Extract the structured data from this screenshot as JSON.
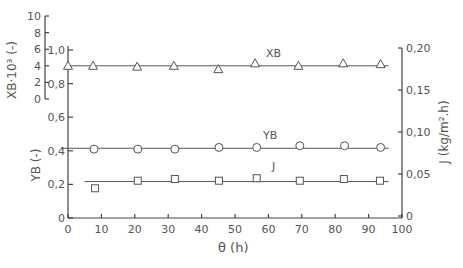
{
  "chart_data": {
    "type": "line",
    "title": "",
    "xlabel": "θ (h)",
    "xlim": [
      0,
      100
    ],
    "x_ticks": [
      0,
      10,
      20,
      30,
      40,
      50,
      60,
      70,
      80,
      90,
      100
    ],
    "axes": {
      "left_outer": {
        "label": "XB·10³ (-)",
        "lim": [
          0,
          10
        ],
        "ticks": [
          "0",
          "2",
          "4",
          "6",
          "8",
          "10"
        ]
      },
      "left_inner": {
        "label": "YB (-)",
        "lim": [
          0,
          1.0
        ],
        "ticks": [
          "0",
          "0,2",
          "0,4",
          "0,6",
          "0,8",
          "1,0"
        ]
      },
      "right": {
        "label": "J (kg/m².h)",
        "lim": [
          0,
          0.2
        ],
        "ticks": [
          "0",
          "0,05",
          "0,10",
          "0,15",
          "0,20"
        ]
      }
    },
    "series": [
      {
        "name": "XB",
        "axis": "left_outer",
        "marker": "triangle",
        "x": [
          0,
          7.5,
          20.7,
          31.7,
          45,
          56,
          69,
          82.4,
          93.6
        ],
        "values": [
          4.0,
          4.0,
          3.9,
          4.0,
          3.6,
          4.3,
          4.0,
          4.3,
          4.2
        ]
      },
      {
        "name": "YB",
        "axis": "left_inner",
        "marker": "circle",
        "x": [
          7.8,
          20.9,
          32,
          45.2,
          56.5,
          69.4,
          82.8,
          93.6
        ],
        "values": [
          0.41,
          0.41,
          0.41,
          0.42,
          0.42,
          0.43,
          0.43,
          0.42
        ]
      },
      {
        "name": "J",
        "axis": "right",
        "marker": "square",
        "x": [
          8.1,
          20.9,
          32,
          45.2,
          56.5,
          69.4,
          82.6,
          93.4
        ],
        "values": [
          0.033,
          0.042,
          0.044,
          0.042,
          0.045,
          0.042,
          0.044,
          0.042
        ]
      }
    ],
    "fit_lines": [
      {
        "series": "XB",
        "y": 4.0,
        "x_range": [
          0,
          96
        ]
      },
      {
        "series": "YB",
        "y": 0.415,
        "x_range": [
          -2,
          96
        ]
      },
      {
        "series": "J",
        "y": 0.041,
        "x_range": [
          5,
          96
        ]
      }
    ],
    "annotations": [
      {
        "text": "XB",
        "near": "XB"
      },
      {
        "text": "YB",
        "near": "YB"
      },
      {
        "text": "J",
        "near": "J"
      }
    ],
    "grid": false,
    "legend": "inline labels"
  },
  "labels": {
    "xlabel": "θ  (h)",
    "left_outer": "XB·10³  (-)",
    "left_inner": "YB  (-)",
    "right": "J  (kg/m².h)",
    "series_xb": "XB",
    "series_yb": "YB",
    "series_j": "J"
  }
}
